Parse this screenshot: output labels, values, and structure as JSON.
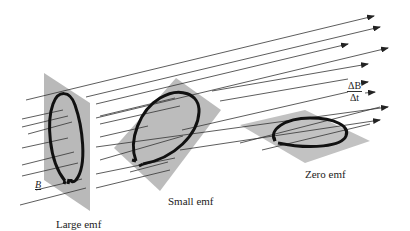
{
  "figure": {
    "colors": {
      "background": "#ffffff",
      "plate": "#b8b8b8",
      "loop": "#111111",
      "field_line": "#333333"
    },
    "labels": {
      "field": "B",
      "rate_numerator": "ΔB",
      "rate_denominator": "Δt",
      "loops": [
        {
          "id": "large",
          "caption": "Large emf",
          "orientation": "perpendicular to field"
        },
        {
          "id": "small",
          "caption": "Small emf",
          "orientation": "tilted to field"
        },
        {
          "id": "zero",
          "caption": "Zero emf",
          "orientation": "parallel to field"
        }
      ]
    },
    "icons": {
      "field_arrow": "arrowhead-icon",
      "loop": "wire-loop-icon"
    }
  }
}
